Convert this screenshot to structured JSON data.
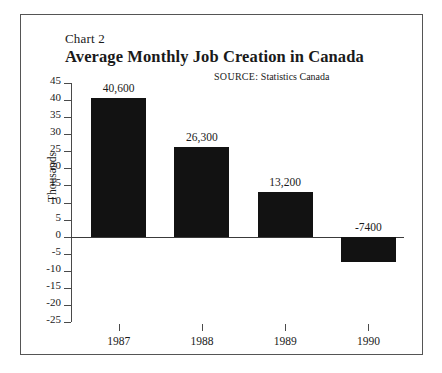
{
  "figure": {
    "chart_number": "Chart 2",
    "title": "Average Monthly Job Creation in Canada",
    "source_key": "SOURCE:",
    "source_value": "Statistics Canada"
  },
  "chart_data": {
    "type": "bar",
    "title": "Average Monthly Job Creation in Canada",
    "subtitle": "Chart 2",
    "annotations": [
      "SOURCE: Statistics Canada"
    ],
    "xlabel": "",
    "ylabel": "Thousands",
    "categories": [
      "1987",
      "1988",
      "1989",
      "1990"
    ],
    "values": [
      40.6,
      26.3,
      13.2,
      -7.4
    ],
    "data_labels": [
      "40,600",
      "26,300",
      "13,200",
      "-7400"
    ],
    "ylim": [
      -25,
      45
    ],
    "ytick_step": 5,
    "yticks": [
      45,
      40,
      35,
      30,
      25,
      20,
      15,
      10,
      5,
      0,
      -5,
      -10,
      -15,
      -20,
      -25
    ],
    "ytick_labels": [
      "45",
      "40",
      "35",
      "30",
      "25",
      "20",
      "15",
      "10",
      "5",
      "0",
      "-5",
      "-10",
      "-15",
      "-20",
      "-25"
    ],
    "grid": false,
    "legend": null,
    "bar_color": "#121212",
    "axis_color": "#4a4a4a"
  }
}
